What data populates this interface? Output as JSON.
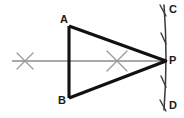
{
  "figure": {
    "name": "triangle-abp-with-arc-construction",
    "background_color": "#ffffff",
    "width": 184,
    "height": 118,
    "labels": {
      "a": "A",
      "b": "B",
      "c": "C",
      "d": "D",
      "p": "P"
    },
    "colors": {
      "triangle_stroke": "#111111",
      "axis_line": "#8c8c8c",
      "cross_mark": "#9a9a9a",
      "arc_stroke": "#3a3a3a",
      "label_text": "#1b1b1b"
    },
    "points": {
      "A": {
        "x": 69,
        "y": 26
      },
      "B": {
        "x": 69,
        "y": 98
      },
      "P": {
        "x": 166,
        "y": 61
      }
    },
    "axis": {
      "name": "horizontal-center-line",
      "x1": 12,
      "y1": 61,
      "x2": 166,
      "y2": 61
    },
    "crosses": [
      {
        "name": "cross-mark-left",
        "x": 25,
        "y": 61,
        "size": 9
      },
      {
        "name": "cross-mark-right",
        "x": 117,
        "y": 61,
        "size": 11
      }
    ],
    "arc": {
      "name": "vertical-construction-arc",
      "x": 165,
      "y_top": 5,
      "y_bottom": 110,
      "bulge": 3,
      "tick_count": 4
    }
  }
}
